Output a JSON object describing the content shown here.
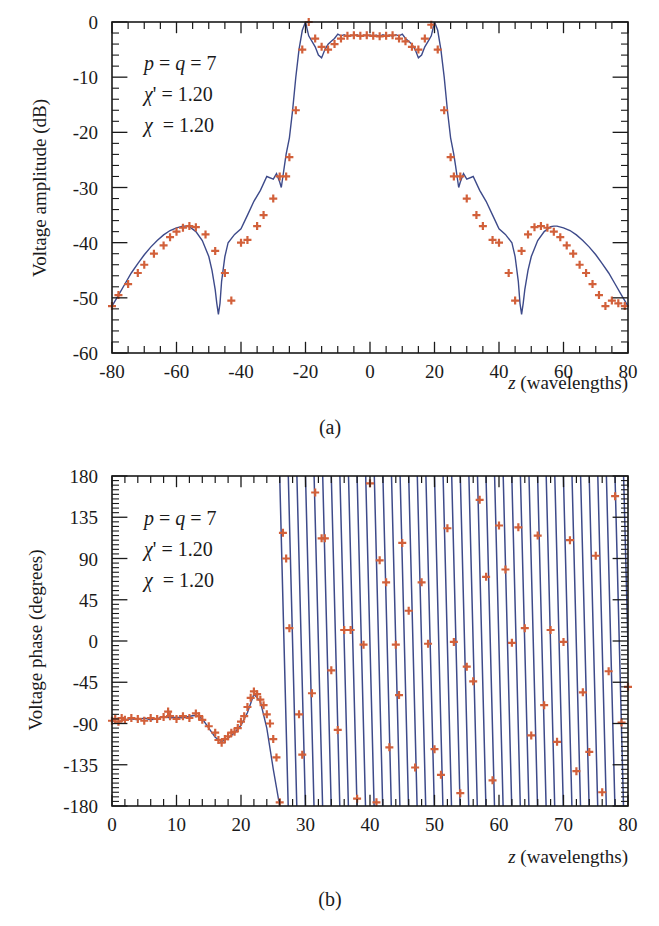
{
  "chart_data": [
    {
      "id": "a",
      "type": "line",
      "caption": "(a)",
      "title": "",
      "xlabel_var": "z",
      "xlabel_rest": " (wavelengths)",
      "ylabel": "Voltage amplitude (dB)",
      "xlim": [
        -80,
        80
      ],
      "ylim": [
        -60,
        0
      ],
      "xticks": [
        -80,
        -60,
        -40,
        -20,
        0,
        20,
        40,
        60,
        80
      ],
      "yticks": [
        0,
        -10,
        -20,
        -30,
        -40,
        -50,
        -60
      ],
      "grid": false,
      "annotations": [
        "p = q = 7",
        "χ' = 1.20",
        "χ = 1.20"
      ],
      "series": [
        {
          "name": "theory (line)",
          "color": "#3d4a8a",
          "x": [
            -80,
            -78,
            -76,
            -74,
            -72,
            -70,
            -68,
            -66,
            -64,
            -62,
            -60,
            -58,
            -57,
            -56,
            -54,
            -52,
            -50,
            -49,
            -48,
            -47.5,
            -47,
            -46.5,
            -46,
            -45,
            -44,
            -42,
            -40,
            -38,
            -36,
            -34,
            -32,
            -30,
            -29,
            -28,
            -27.5,
            -27,
            -26.5,
            -26,
            -25,
            -24,
            -23,
            -22,
            -21,
            -20,
            -19,
            -18,
            -17,
            -16,
            -15,
            -14,
            -13,
            -12,
            -11,
            -10,
            -9,
            -8,
            -7,
            -6,
            -5,
            -4,
            -3,
            -2,
            -1,
            0,
            1,
            2,
            3,
            4,
            5,
            6,
            7,
            8,
            9,
            10,
            11,
            12,
            13,
            14,
            15,
            16,
            17,
            18,
            19,
            20,
            21,
            22,
            23,
            24,
            25,
            26,
            26.5,
            27,
            27.5,
            28,
            29,
            30,
            32,
            34,
            36,
            38,
            40,
            42,
            44,
            45,
            46,
            46.5,
            47,
            47.5,
            48,
            49,
            50,
            52,
            54,
            56,
            57,
            58,
            60,
            62,
            64,
            66,
            68,
            70,
            72,
            74,
            76,
            78,
            80
          ],
          "y": [
            -51.5,
            -49.5,
            -47.5,
            -45.5,
            -43.8,
            -42.2,
            -40.8,
            -39.6,
            -38.6,
            -37.8,
            -37.3,
            -37.0,
            -37.0,
            -37.1,
            -38.0,
            -39.6,
            -42.5,
            -45,
            -48.5,
            -51,
            -53,
            -51,
            -47,
            -42.5,
            -40,
            -38.5,
            -37.5,
            -35,
            -32.5,
            -30.5,
            -28,
            -28.5,
            -27.5,
            -29,
            -30,
            -28,
            -26,
            -24,
            -21,
            -16,
            -10,
            -5,
            -1.5,
            0,
            -2.5,
            -3.5,
            -4.5,
            -6,
            -6.5,
            -5,
            -4,
            -3.5,
            -3,
            -2.2,
            -2.5,
            -2.3,
            -2.6,
            -2.4,
            -2.5,
            -2.3,
            -2.6,
            -2.4,
            -2.5,
            -2.4,
            -2.5,
            -2.4,
            -2.6,
            -2.3,
            -2.5,
            -2.4,
            -2.6,
            -2.3,
            -2.5,
            -2.2,
            -3,
            -3.5,
            -4,
            -5,
            -6.5,
            -6,
            -4.5,
            -3.5,
            -2.5,
            0,
            -1.5,
            -5,
            -10,
            -16,
            -21,
            -24,
            -26,
            -28,
            -30,
            -29,
            -27.5,
            -28.5,
            -28,
            -30.5,
            -32.5,
            -35,
            -37.5,
            -38.5,
            -40,
            -42.5,
            -47,
            -51,
            -53,
            -51,
            -48.5,
            -45,
            -42.5,
            -39.6,
            -38.0,
            -37.1,
            -37.0,
            -37.0,
            -37.3,
            -37.8,
            -38.6,
            -39.6,
            -40.8,
            -42.2,
            -43.8,
            -45.5,
            -47.5,
            -49.5,
            -51.5
          ]
        },
        {
          "name": "simulation (markers)",
          "color": "#d2603a",
          "marker": "+",
          "x": [
            -80,
            -78,
            -75,
            -72,
            -70,
            -67,
            -64,
            -62,
            -60,
            -58,
            -56,
            -54,
            -51,
            -48,
            -45,
            -43,
            -40,
            -38,
            -35,
            -33,
            -30,
            -28,
            -26,
            -25,
            -23,
            -21,
            -19,
            -17,
            -15,
            -13,
            -11,
            -9,
            -7,
            -5,
            -3,
            -1,
            1,
            3,
            5,
            7,
            9,
            11,
            13,
            15,
            17,
            19,
            21,
            23,
            25,
            26,
            28,
            30,
            33,
            35,
            38,
            40,
            43,
            45,
            47,
            49,
            51,
            53,
            55,
            57,
            59,
            61,
            63,
            65,
            67,
            69,
            71,
            73,
            75,
            77,
            79
          ],
          "y": [
            -51.5,
            -49.5,
            -47.5,
            -45.5,
            -44,
            -42,
            -40.5,
            -39,
            -38,
            -37.3,
            -37,
            -37.2,
            -38.5,
            -41.5,
            -45.5,
            -50.5,
            -40,
            -39.5,
            -37,
            -35,
            -32,
            -28,
            -28,
            -24.5,
            -16,
            -5,
            0,
            -3,
            -4.5,
            -5,
            -4,
            -3,
            -2.5,
            -2.4,
            -2.5,
            -2.4,
            -2.5,
            -2.6,
            -2.5,
            -2.4,
            -3,
            -3.5,
            -4.5,
            -5,
            -3,
            -0.5,
            -5,
            -16,
            -24.5,
            -28,
            -28,
            -32,
            -35,
            -37,
            -39.5,
            -40,
            -45.5,
            -50.5,
            -41.5,
            -38.5,
            -37.2,
            -37,
            -37.3,
            -38,
            -39,
            -40.5,
            -42,
            -44,
            -45.5,
            -47.5,
            -49.5,
            -51.5,
            -50.5,
            -51,
            -51.5
          ]
        }
      ]
    },
    {
      "id": "b",
      "type": "line",
      "caption": "(b)",
      "title": "",
      "xlabel_var": "z",
      "xlabel_rest": " (wavelengths)",
      "ylabel": "Voltage phase (degrees)",
      "xlim": [
        0,
        80
      ],
      "ylim": [
        -180,
        180
      ],
      "xticks": [
        0,
        10,
        20,
        30,
        40,
        50,
        60,
        70,
        80
      ],
      "yticks": [
        180,
        135,
        90,
        45,
        0,
        -45,
        -90,
        -135,
        -180
      ],
      "grid": false,
      "annotations": [
        "p = q = 7",
        "χ' = 1.20",
        "χ = 1.20"
      ],
      "notes": "For z < 26 phase is smooth near -90°, dipping to about -110° at z≈17 and peaking near -55° at z≈22; beyond z≈26 the phase wraps rapidly between -180° and 180° (period ≈ 1.33 wavelengths).",
      "series": [
        {
          "name": "theory (line)",
          "color": "#3d4a8a",
          "smooth_x": [
            0,
            1,
            2,
            3,
            4,
            5,
            6,
            7,
            8,
            9,
            10,
            11,
            12,
            13,
            14,
            15,
            16,
            17,
            18,
            19,
            20,
            21,
            22,
            23,
            24,
            25,
            25.5,
            26
          ],
          "smooth_y": [
            -87,
            -88,
            -86,
            -85,
            -86,
            -84,
            -86,
            -85,
            -82,
            -84,
            -83,
            -84,
            -82,
            -81,
            -85,
            -95,
            -105,
            -110,
            -106,
            -100,
            -92,
            -78,
            -58,
            -66,
            -95,
            -140,
            -160,
            -180
          ],
          "wrap_start": 26,
          "wrap_period": 1.333
        },
        {
          "name": "simulation (markers)",
          "color": "#d2603a",
          "marker": "+",
          "x": [
            0,
            0.5,
            1,
            1.5,
            2,
            3,
            4,
            5,
            6,
            7,
            8,
            8.7,
            9,
            10,
            11,
            12,
            13,
            13.5,
            14,
            15,
            16,
            16.5,
            17,
            17.5,
            18,
            18.5,
            19,
            19.5,
            20,
            20.5,
            21,
            21.5,
            22,
            22.5,
            23,
            23.5,
            24,
            24.5,
            25,
            25.5,
            26,
            26.5,
            27,
            27.5,
            29,
            29.5,
            31,
            31.5,
            32.5,
            33,
            34,
            35,
            36,
            37,
            38,
            39,
            40,
            41,
            41.5,
            42.5,
            43,
            44,
            44.5,
            45,
            46,
            47,
            48,
            49,
            50,
            51,
            52,
            53,
            54,
            55,
            56,
            57,
            58,
            59,
            60,
            61,
            62,
            63,
            64,
            65,
            66,
            67,
            68,
            69,
            70,
            71,
            72,
            73,
            74,
            75,
            76,
            77,
            78,
            79,
            80
          ],
          "y": [
            -87,
            -85,
            -88,
            -84,
            -86,
            -84,
            -85,
            -87,
            -84,
            -85,
            -83,
            -77,
            -82,
            -85,
            -82,
            -84,
            -79,
            -82,
            -86,
            -93,
            -100,
            -108,
            -111,
            -107,
            -104,
            -100,
            -99,
            -95,
            -88,
            -82,
            -72,
            -62,
            -55,
            -58,
            -64,
            -70,
            -80,
            -90,
            -107,
            -127,
            -176,
            118,
            90,
            14,
            -80,
            -124,
            -57,
            162,
            112,
            112,
            -32,
            -97,
            12,
            12,
            -172,
            -4,
            172,
            -176,
            88,
            64,
            -116,
            -4,
            -59,
            107,
            33,
            -138,
            64,
            -3,
            -118,
            -146,
            123,
            -1,
            -166,
            -28,
            -44,
            154,
            70,
            -152,
            126,
            78,
            -2,
            124,
            14,
            -103,
            115,
            -70,
            12,
            -110,
            -1,
            110,
            -142,
            -56,
            -121,
            93,
            -165,
            -33,
            158,
            -89,
            -50,
            120,
            0
          ]
        }
      ]
    }
  ]
}
